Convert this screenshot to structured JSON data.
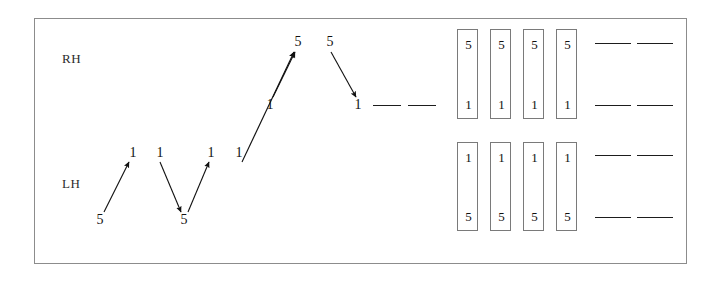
{
  "figure": {
    "background_color": "#ffffff",
    "frame_color": "#8c8c8c",
    "ink_color": "#111111",
    "width": 722,
    "height": 283
  },
  "labels": {
    "right_hand": "RH",
    "left_hand": "LH"
  },
  "lh_sequence": {
    "name": "left-hand-finger-sequence",
    "digits": [
      {
        "text": "5",
        "x": 100,
        "y": 220
      },
      {
        "text": "1",
        "x": 133,
        "y": 153
      },
      {
        "text": "1",
        "x": 160,
        "y": 153
      },
      {
        "text": "5",
        "x": 184,
        "y": 220
      },
      {
        "text": "1",
        "x": 211,
        "y": 153
      },
      {
        "text": "1",
        "x": 239,
        "y": 153
      }
    ],
    "arrows": [
      {
        "name": "arrow-5-to-1-up",
        "x1": 104,
        "y1": 212,
        "x2": 129,
        "y2": 162
      },
      {
        "name": "arrow-1-to-5-down",
        "x1": 160,
        "y1": 162,
        "x2": 181,
        "y2": 212
      },
      {
        "name": "arrow-5-to-1-up-2",
        "x1": 188,
        "y1": 212,
        "x2": 209,
        "y2": 162
      },
      {
        "name": "arrow-1-to-5-cross-up",
        "x1": 242,
        "y1": 162,
        "x2": 294,
        "y2": 52
      }
    ]
  },
  "rh_sequence": {
    "name": "right-hand-finger-sequence",
    "digits": [
      {
        "text": "1",
        "x": 270,
        "y": 105
      },
      {
        "text": "5",
        "x": 298,
        "y": 42
      },
      {
        "text": "5",
        "x": 330,
        "y": 42
      },
      {
        "text": "1",
        "x": 358,
        "y": 105
      }
    ],
    "arrows": [
      {
        "name": "arrow-1-to-5-up-rh",
        "x1": 273,
        "y1": 97,
        "x2": 295,
        "y2": 52
      },
      {
        "name": "arrow-5-to-1-down-rh",
        "x1": 331,
        "y1": 52,
        "x2": 356,
        "y2": 97
      }
    ]
  },
  "mid_dashes": {
    "name": "continuation-dashes-middle",
    "items": [
      {
        "x": 373,
        "y": 105,
        "w": 28
      },
      {
        "x": 408,
        "y": 105,
        "w": 28
      }
    ]
  },
  "boxes": {
    "name": "hand-position-boxes",
    "top_row": [
      {
        "x": 457,
        "y": 29,
        "w": 21,
        "h": 90,
        "top_digit": "5",
        "bottom_digit": "1"
      },
      {
        "x": 490,
        "y": 29,
        "w": 21,
        "h": 90,
        "top_digit": "5",
        "bottom_digit": "1"
      },
      {
        "x": 523,
        "y": 29,
        "w": 21,
        "h": 90,
        "top_digit": "5",
        "bottom_digit": "1"
      },
      {
        "x": 556,
        "y": 29,
        "w": 21,
        "h": 90,
        "top_digit": "5",
        "bottom_digit": "1"
      }
    ],
    "bottom_row": [
      {
        "x": 457,
        "y": 142,
        "w": 21,
        "h": 89,
        "top_digit": "1",
        "bottom_digit": "5"
      },
      {
        "x": 490,
        "y": 142,
        "w": 21,
        "h": 89,
        "top_digit": "1",
        "bottom_digit": "5"
      },
      {
        "x": 523,
        "y": 142,
        "w": 21,
        "h": 89,
        "top_digit": "1",
        "bottom_digit": "5"
      },
      {
        "x": 556,
        "y": 142,
        "w": 21,
        "h": 89,
        "top_digit": "1",
        "bottom_digit": "5"
      }
    ]
  },
  "right_dashes": {
    "name": "continuation-dashes-right",
    "rows": [
      {
        "y": 43,
        "items": [
          {
            "x": 595,
            "w": 36
          },
          {
            "x": 637,
            "w": 36
          }
        ]
      },
      {
        "y": 105,
        "items": [
          {
            "x": 595,
            "w": 36
          },
          {
            "x": 637,
            "w": 36
          }
        ]
      },
      {
        "y": 155,
        "items": [
          {
            "x": 595,
            "w": 36
          },
          {
            "x": 637,
            "w": 36
          }
        ]
      },
      {
        "y": 217,
        "items": [
          {
            "x": 595,
            "w": 36
          },
          {
            "x": 637,
            "w": 36
          }
        ]
      }
    ]
  },
  "chart_data": {
    "type": "diagram",
    "lh_path": [
      "5",
      "1",
      "1",
      "5",
      "1",
      "1"
    ],
    "rh_path": [
      "1",
      "5",
      "5",
      "1"
    ],
    "box_columns": 4,
    "box_rows": 2,
    "box_top_row_digits": [
      [
        "5",
        "1"
      ],
      [
        "5",
        "1"
      ],
      [
        "5",
        "1"
      ],
      [
        "5",
        "1"
      ]
    ],
    "box_bottom_row_digits": [
      [
        "1",
        "5"
      ],
      [
        "1",
        "5"
      ],
      [
        "1",
        "5"
      ],
      [
        "1",
        "5"
      ]
    ],
    "dash_rows": 4,
    "dashes_per_row": 2
  }
}
